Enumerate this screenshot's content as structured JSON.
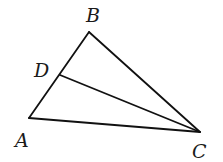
{
  "figure": {
    "type": "triangle-with-cevian",
    "points": {
      "A": {
        "label": "A",
        "x": 29,
        "y": 118,
        "label_x": 15,
        "label_y": 147
      },
      "B": {
        "label": "B",
        "x": 89,
        "y": 32,
        "label_x": 86,
        "label_y": 22
      },
      "C": {
        "label": "C",
        "x": 200,
        "y": 132,
        "label_x": 192,
        "label_y": 158
      },
      "D": {
        "label": "D",
        "x": 60,
        "y": 75,
        "label_x": 34,
        "label_y": 77
      }
    },
    "segments": [
      "AB",
      "BC",
      "CA",
      "DC"
    ],
    "line_color": "#111111",
    "background": "#ffffff"
  }
}
